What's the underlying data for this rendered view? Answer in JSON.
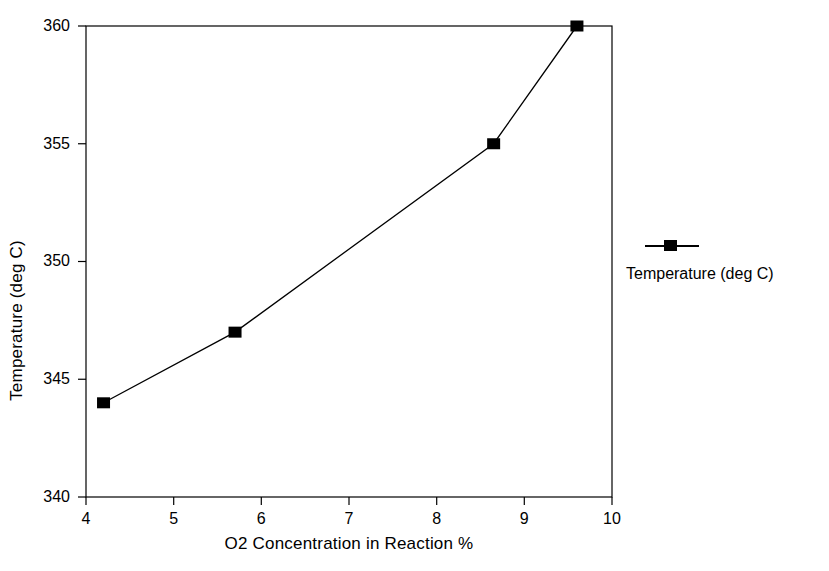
{
  "chart_data": {
    "type": "line",
    "title": "",
    "xlabel": "O2 Concentration in Reaction %",
    "ylabel": "Temperature (deg C)",
    "xlim": [
      4,
      10
    ],
    "ylim": [
      340,
      360
    ],
    "xticks": [
      4,
      5,
      6,
      7,
      8,
      9,
      10
    ],
    "yticks": [
      340,
      345,
      350,
      355,
      360
    ],
    "xtick_labels": [
      "4",
      "5",
      "6",
      "7",
      "8",
      "9",
      "10"
    ],
    "ytick_labels": [
      "340",
      "345",
      "350",
      "355",
      "360"
    ],
    "grid": false,
    "legend_position": "right",
    "series": [
      {
        "name": "Temperature (deg C)",
        "color": "#000000",
        "marker": "square-filled",
        "x": [
          4.2,
          5.7,
          8.65,
          9.6
        ],
        "y": [
          344,
          347,
          355,
          360
        ]
      }
    ]
  },
  "legend": {
    "entries": [
      {
        "label": "Temperature (deg C)",
        "marker": "square-marker-icon"
      }
    ]
  }
}
